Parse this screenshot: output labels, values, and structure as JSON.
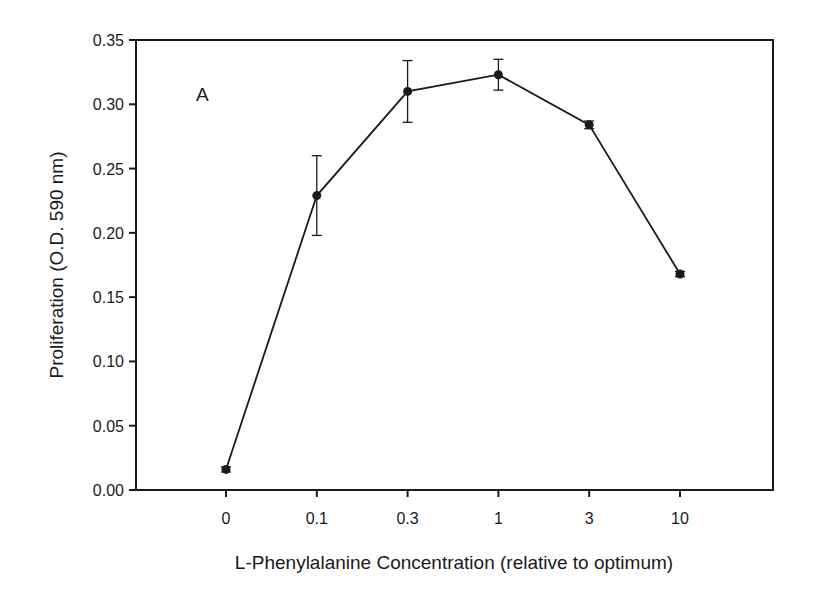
{
  "chart_data": {
    "type": "line",
    "title": "",
    "panel_label": "A",
    "xlabel": "L-Phenylalanine Concentration (relative to optimum)",
    "ylabel": "Proliferation (O.D. 590 nm)",
    "categories": [
      "0",
      "0.1",
      "0.3",
      "1",
      "3",
      "10"
    ],
    "series": [
      {
        "name": "Proliferation",
        "values": [
          0.016,
          0.229,
          0.31,
          0.323,
          0.284,
          0.168
        ],
        "error": [
          0.002,
          0.031,
          0.024,
          0.012,
          0.003,
          0.002
        ],
        "marker": "circle",
        "color": "#1a1a1a"
      }
    ],
    "ylim": [
      0.0,
      0.35
    ],
    "yticks": [
      "0.00",
      "0.05",
      "0.10",
      "0.15",
      "0.20",
      "0.25",
      "0.30",
      "0.35"
    ],
    "grid": false,
    "legend": null,
    "frame": "box"
  }
}
